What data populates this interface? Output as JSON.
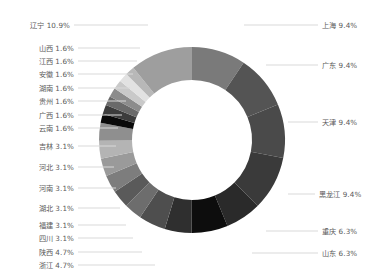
{
  "chart_data": {
    "type": "pie",
    "variant": "donut",
    "title": "",
    "subtitle": "",
    "xlabel": "",
    "ylabel": "",
    "legend_position": "none",
    "grid": false,
    "label_format": "{name} {percent}%",
    "center_x": 192,
    "center_y": 140,
    "outer_radius": 93,
    "inner_radius": 60,
    "start_angle_deg": -90,
    "direction": "clockwise",
    "categories": [
      "上海",
      "广东",
      "天津",
      "黑龙江",
      "重庆",
      "山东",
      "浙江",
      "陕西",
      "四川",
      "福建",
      "湖北",
      "河南",
      "河北",
      "吉林",
      "云南",
      "广西",
      "贵州",
      "湖南",
      "安徽",
      "江西",
      "山西",
      "辽宁"
    ],
    "values": [
      9.4,
      9.4,
      9.4,
      9.4,
      6.3,
      6.3,
      4.7,
      4.7,
      3.1,
      3.1,
      3.1,
      3.1,
      3.1,
      3.1,
      1.6,
      1.6,
      1.6,
      1.6,
      1.6,
      1.6,
      1.6,
      10.9
    ],
    "unit": "%",
    "colors": [
      "#7a7a7a",
      "#545454",
      "#4a4a4a",
      "#3a3a3a",
      "#2a2a2a",
      "#0d0d0d",
      "#2f2f2f",
      "#4e4e4e",
      "#6d6d6d",
      "#5a5a5a",
      "#7d7d7d",
      "#9a9a9a",
      "#b4b4b4",
      "#8f8f8f",
      "#0a0a0a",
      "#3c3c3c",
      "#6a6a6a",
      "#8c8c8c",
      "#c9c9c9",
      "#e2e2e2",
      "#b8b8b8",
      "#9e9e9e"
    ],
    "labels_left": [
      {
        "name": "辽宁",
        "percent": "10.9%",
        "text": "辽宁 10.9%",
        "y": 21,
        "lead_y": 25,
        "lead_x1": 74,
        "lead_x2": 148
      },
      {
        "name": "山西",
        "percent": "1.6%",
        "text": "山西 1.6%",
        "y": 44,
        "lead_y": 48,
        "lead_x1": 78,
        "lead_x2": 140
      },
      {
        "name": "江西",
        "percent": "1.6%",
        "text": "江西 1.6%",
        "y": 57,
        "lead_y": 61,
        "lead_x1": 78,
        "lead_x2": 137
      },
      {
        "name": "安徽",
        "percent": "1.6%",
        "text": "安徽 1.6%",
        "y": 70,
        "lead_y": 74,
        "lead_x1": 78,
        "lead_x2": 133
      },
      {
        "name": "湖南",
        "percent": "1.6%",
        "text": "湖南 1.6%",
        "y": 84,
        "lead_y": 88,
        "lead_x1": 78,
        "lead_x2": 130
      },
      {
        "name": "贵州",
        "percent": "1.6%",
        "text": "贵州 1.6%",
        "y": 97,
        "lead_y": 101,
        "lead_x1": 78,
        "lead_x2": 126
      },
      {
        "name": "广西",
        "percent": "1.6%",
        "text": "广西 1.6%",
        "y": 111,
        "lead_y": 115,
        "lead_x1": 78,
        "lead_x2": 122
      },
      {
        "name": "云南",
        "percent": "1.6%",
        "text": "云南 1.6%",
        "y": 124,
        "lead_y": 128,
        "lead_x1": 78,
        "lead_x2": 118
      },
      {
        "name": "吉林",
        "percent": "3.1%",
        "text": "吉林 3.1%",
        "y": 142,
        "lead_y": 146,
        "lead_x1": 78,
        "lead_x2": 116
      },
      {
        "name": "河北",
        "percent": "3.1%",
        "text": "河北 3.1%",
        "y": 163,
        "lead_y": 167,
        "lead_x1": 78,
        "lead_x2": 114
      },
      {
        "name": "河南",
        "percent": "3.1%",
        "text": "河南 3.1%",
        "y": 184,
        "lead_y": 188,
        "lead_x1": 78,
        "lead_x2": 116
      },
      {
        "name": "湖北",
        "percent": "3.1%",
        "text": "湖北 3.1%",
        "y": 204,
        "lead_y": 208,
        "lead_x1": 78,
        "lead_x2": 120
      },
      {
        "name": "福建",
        "percent": "3.1%",
        "text": "福建 3.1%",
        "y": 221,
        "lead_y": 225,
        "lead_x1": 78,
        "lead_x2": 126
      },
      {
        "name": "四川",
        "percent": "3.1%",
        "text": "四川 3.1%",
        "y": 234,
        "lead_y": 238,
        "lead_x1": 78,
        "lead_x2": 133
      },
      {
        "name": "陕西",
        "percent": "4.7%",
        "text": "陕西 4.7%",
        "y": 248,
        "lead_y": 252,
        "lead_x1": 78,
        "lead_x2": 142
      },
      {
        "name": "浙江",
        "percent": "4.7%",
        "text": "浙江 4.7%",
        "y": 261,
        "lead_y": 265,
        "lead_x1": 78,
        "lead_x2": 155
      }
    ],
    "labels_right": [
      {
        "name": "上海",
        "percent": "9.4%",
        "text": "上海 9.4%",
        "y": 21,
        "lead_y": 25,
        "lead_x1": 244,
        "lead_x2": 318
      },
      {
        "name": "广东",
        "percent": "9.4%",
        "text": "广东 9.4%",
        "y": 61,
        "lead_y": 65,
        "lead_x1": 266,
        "lead_x2": 318
      },
      {
        "name": "天津",
        "percent": "9.4%",
        "text": "天津 9.4%",
        "y": 118,
        "lead_y": 122,
        "lead_x1": 288,
        "lead_x2": 318
      },
      {
        "name": "黑龙江",
        "percent": "9.4%",
        "text": "黑龙江 9.4%",
        "y": 190,
        "lead_y": 194,
        "lead_x1": 288,
        "lead_x2": 315
      },
      {
        "name": "重庆",
        "percent": "6.3%",
        "text": "重庆 6.3%",
        "y": 227,
        "lead_y": 231,
        "lead_x1": 266,
        "lead_x2": 318
      },
      {
        "name": "山东",
        "percent": "6.3%",
        "text": "山东 6.3%",
        "y": 249,
        "lead_y": 253,
        "lead_x1": 252,
        "lead_x2": 318
      }
    ]
  },
  "style": {
    "background": "#ffffff",
    "leader_line_color": "#d9d9d9",
    "label_color": "#5b5b5b"
  }
}
